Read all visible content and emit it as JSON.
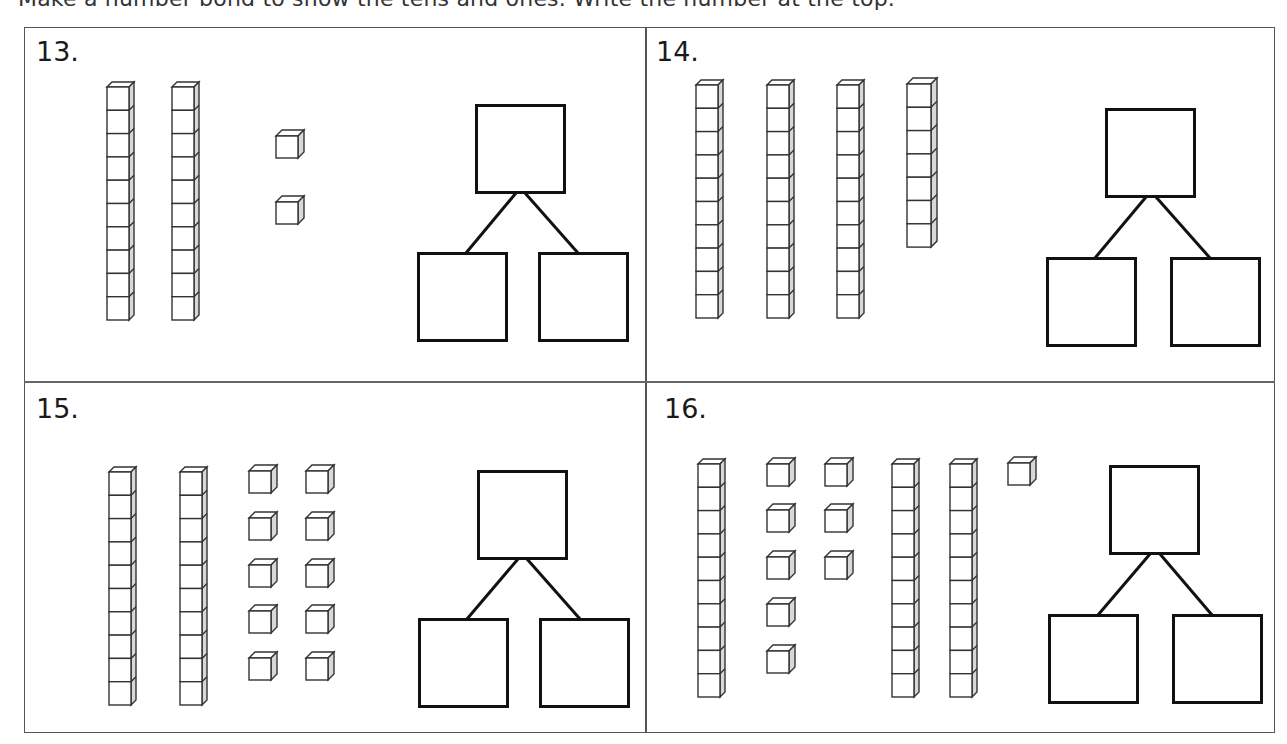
{
  "instruction": "Make a number bond to show the tens and ones. Write the number at the top.",
  "problems": [
    {
      "number": "13.",
      "tens_rods": 2,
      "ones_cubes": 2,
      "bond": {
        "whole": "",
        "part_left": "",
        "part_right": ""
      }
    },
    {
      "number": "14.",
      "tens_rods": 3,
      "ones_cubes": 7,
      "bond": {
        "whole": "",
        "part_left": "",
        "part_right": ""
      }
    },
    {
      "number": "15.",
      "tens_rods": 2,
      "ones_cubes": 10,
      "bond": {
        "whole": "",
        "part_left": "",
        "part_right": ""
      }
    },
    {
      "number": "16.",
      "tens_rods": 3,
      "ones_cubes": 9,
      "bond": {
        "whole": "",
        "part_left": "",
        "part_right": ""
      }
    }
  ],
  "colors": {
    "line": "#111111",
    "block_outline": "#333333",
    "block_side": "#d8d8d8",
    "border": "#555555"
  }
}
